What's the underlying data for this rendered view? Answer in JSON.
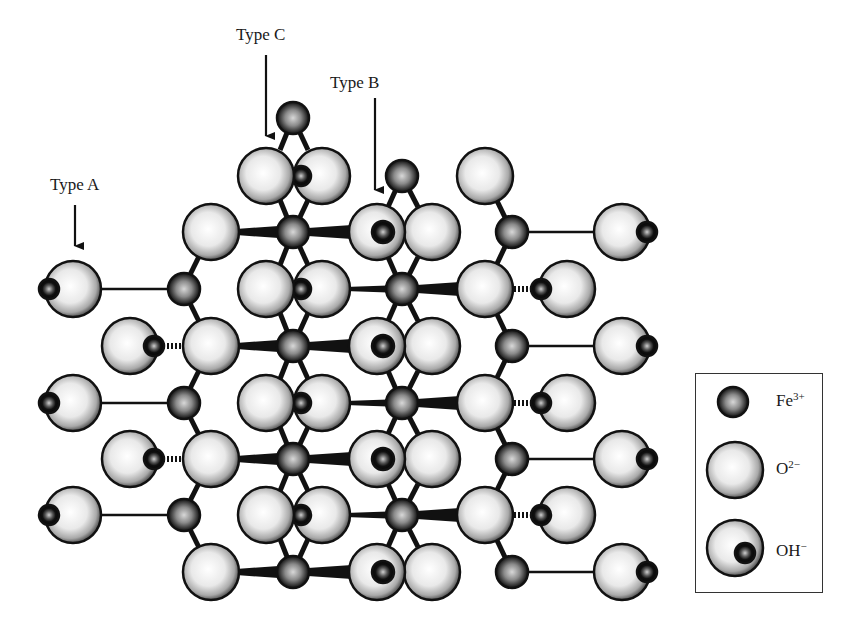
{
  "figure": {
    "type_labels": [
      {
        "id": "A",
        "text": "Type A"
      },
      {
        "id": "B",
        "text": "Type B"
      },
      {
        "id": "C",
        "text": "Type C"
      }
    ]
  },
  "legend": {
    "items": [
      {
        "symbol": "Fe",
        "charge": "3+",
        "meaning": "iron cation"
      },
      {
        "symbol": "O",
        "charge": "2−",
        "meaning": "oxide anion"
      },
      {
        "symbol": "OH",
        "charge": "−",
        "meaning": "hydroxyl"
      }
    ]
  },
  "colors": {
    "background": "#ffffff",
    "outline": "#111111",
    "oxygen_fill": "#e8e8e8",
    "iron_fill": "#8a8a8a"
  }
}
